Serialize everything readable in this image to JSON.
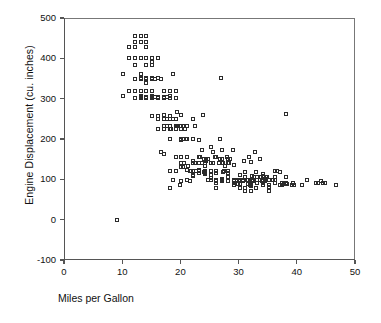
{
  "chart_data": {
    "type": "scatter",
    "title": "",
    "xlabel": "Miles per Gallon",
    "ylabel": "Engine Displacement (cu. inches)",
    "xlim": [
      0,
      50
    ],
    "ylim": [
      -100,
      500
    ],
    "xticks": [
      "0",
      "10",
      "20",
      "30",
      "40",
      "50"
    ],
    "xtick_values": [
      0,
      10,
      20,
      30,
      40,
      50
    ],
    "yticks": [
      "500",
      "400",
      "300",
      "200",
      "100",
      "0",
      "-100"
    ],
    "ytick_values": [
      500,
      400,
      300,
      200,
      100,
      0,
      -100
    ],
    "grid": false,
    "legend": "none",
    "marker": "open-square",
    "marker_color": "#2b2b2b",
    "series_name": "Automobiles",
    "points": [
      [
        9.0,
        0
      ],
      [
        10.0,
        307
      ],
      [
        10.0,
        360
      ],
      [
        11.0,
        318
      ],
      [
        11.0,
        429
      ],
      [
        11.0,
        400
      ],
      [
        12.0,
        455
      ],
      [
        12.0,
        383
      ],
      [
        12.0,
        400
      ],
      [
        12.0,
        350
      ],
      [
        12.0,
        350
      ],
      [
        12.0,
        318
      ],
      [
        12.0,
        302
      ],
      [
        12.0,
        429
      ],
      [
        12.0,
        440
      ],
      [
        13.0,
        400
      ],
      [
        13.0,
        350
      ],
      [
        13.0,
        351
      ],
      [
        13.0,
        440
      ],
      [
        13.0,
        455
      ],
      [
        13.0,
        350
      ],
      [
        13.0,
        318
      ],
      [
        13.0,
        302
      ],
      [
        13.0,
        307
      ],
      [
        13.0,
        304
      ],
      [
        13.0,
        350
      ],
      [
        13.0,
        400
      ],
      [
        13.0,
        360
      ],
      [
        13.0,
        307
      ],
      [
        13.0,
        318
      ],
      [
        13.0,
        400
      ],
      [
        14.0,
        455
      ],
      [
        14.0,
        440
      ],
      [
        14.0,
        455
      ],
      [
        14.0,
        350
      ],
      [
        14.0,
        351
      ],
      [
        14.0,
        383
      ],
      [
        14.0,
        340
      ],
      [
        14.0,
        400
      ],
      [
        14.0,
        302
      ],
      [
        14.0,
        350
      ],
      [
        14.0,
        318
      ],
      [
        14.0,
        429
      ],
      [
        14.0,
        304
      ],
      [
        14.0,
        351
      ],
      [
        14.0,
        400
      ],
      [
        15.0,
        350
      ],
      [
        15.0,
        400
      ],
      [
        15.0,
        383
      ],
      [
        15.0,
        350
      ],
      [
        15.0,
        351
      ],
      [
        15.0,
        302
      ],
      [
        15.0,
        304
      ],
      [
        15.0,
        318
      ],
      [
        15.0,
        307
      ],
      [
        15.0,
        390
      ],
      [
        15.0,
        400
      ],
      [
        15.0,
        350
      ],
      [
        15.0,
        258
      ],
      [
        15.5,
        350
      ],
      [
        15.5,
        304
      ],
      [
        16.0,
        250
      ],
      [
        16.0,
        225
      ],
      [
        16.0,
        258
      ],
      [
        16.0,
        302
      ],
      [
        16.0,
        304
      ],
      [
        16.0,
        351
      ],
      [
        16.0,
        250
      ],
      [
        16.0,
        400
      ],
      [
        16.0,
        305
      ],
      [
        16.5,
        350
      ],
      [
        16.5,
        168
      ],
      [
        16.5,
        168
      ],
      [
        17.0,
        250
      ],
      [
        17.0,
        231
      ],
      [
        17.0,
        225
      ],
      [
        17.0,
        305
      ],
      [
        17.0,
        302
      ],
      [
        17.0,
        318
      ],
      [
        17.0,
        260
      ],
      [
        17.0,
        163
      ],
      [
        17.5,
        250
      ],
      [
        17.5,
        305
      ],
      [
        17.5,
        231
      ],
      [
        18.0,
        307
      ],
      [
        18.0,
        318
      ],
      [
        18.0,
        250
      ],
      [
        18.0,
        225
      ],
      [
        18.0,
        232
      ],
      [
        18.0,
        258
      ],
      [
        18.0,
        302
      ],
      [
        18.0,
        121
      ],
      [
        18.0,
        199
      ],
      [
        18.0,
        78
      ],
      [
        18.1,
        258
      ],
      [
        18.2,
        225
      ],
      [
        18.5,
        360
      ],
      [
        18.5,
        250
      ],
      [
        18.5,
        98
      ],
      [
        19.0,
        232
      ],
      [
        19.0,
        250
      ],
      [
        19.0,
        225
      ],
      [
        19.0,
        156
      ],
      [
        19.0,
        250
      ],
      [
        19.0,
        120
      ],
      [
        19.0,
        121
      ],
      [
        19.0,
        232
      ],
      [
        19.0,
        318
      ],
      [
        19.0,
        302
      ],
      [
        19.2,
        267
      ],
      [
        19.2,
        232
      ],
      [
        19.4,
        232
      ],
      [
        19.8,
        85
      ],
      [
        19.9,
        260
      ],
      [
        20.0,
        198
      ],
      [
        20.0,
        225
      ],
      [
        20.0,
        232
      ],
      [
        20.0,
        200
      ],
      [
        20.0,
        140
      ],
      [
        20.0,
        130
      ],
      [
        20.0,
        131
      ],
      [
        20.0,
        156
      ],
      [
        20.0,
        232
      ],
      [
        20.0,
        97
      ],
      [
        20.2,
        232
      ],
      [
        20.2,
        200
      ],
      [
        20.3,
        131
      ],
      [
        20.5,
        200
      ],
      [
        20.5,
        140
      ],
      [
        20.6,
        225
      ],
      [
        20.8,
        200
      ],
      [
        21.0,
        200
      ],
      [
        21.0,
        199
      ],
      [
        21.0,
        122
      ],
      [
        21.0,
        231
      ],
      [
        21.0,
        98
      ],
      [
        21.0,
        155
      ],
      [
        21.1,
        134
      ],
      [
        21.5,
        121
      ],
      [
        21.5,
        97
      ],
      [
        21.6,
        121
      ],
      [
        22.0,
        250
      ],
      [
        22.0,
        121
      ],
      [
        22.0,
        146
      ],
      [
        22.0,
        200
      ],
      [
        22.0,
        140
      ],
      [
        22.0,
        108
      ],
      [
        22.0,
        110
      ],
      [
        22.3,
        140
      ],
      [
        22.4,
        231
      ],
      [
        22.5,
        120
      ],
      [
        23.0,
        120
      ],
      [
        23.0,
        198
      ],
      [
        23.0,
        156
      ],
      [
        23.0,
        115
      ],
      [
        23.0,
        140
      ],
      [
        23.0,
        122
      ],
      [
        23.0,
        140
      ],
      [
        23.2,
        156
      ],
      [
        23.5,
        173
      ],
      [
        23.6,
        140
      ],
      [
        23.7,
        260
      ],
      [
        23.8,
        151
      ],
      [
        23.9,
        119
      ],
      [
        24.0,
        121
      ],
      [
        24.0,
        113
      ],
      [
        24.0,
        116
      ],
      [
        24.0,
        134
      ],
      [
        24.0,
        140
      ],
      [
        24.0,
        120
      ],
      [
        24.2,
        146
      ],
      [
        24.3,
        151
      ],
      [
        24.5,
        151
      ],
      [
        24.5,
        98
      ],
      [
        25.0,
        98
      ],
      [
        25.0,
        140
      ],
      [
        25.0,
        110
      ],
      [
        25.0,
        104
      ],
      [
        25.0,
        121
      ],
      [
        25.0,
        98
      ],
      [
        25.0,
        181
      ],
      [
        25.1,
        140
      ],
      [
        25.4,
        168
      ],
      [
        25.5,
        140
      ],
      [
        25.8,
        156
      ],
      [
        26.0,
        96
      ],
      [
        26.0,
        97
      ],
      [
        26.0,
        98
      ],
      [
        26.0,
        91
      ],
      [
        26.0,
        121
      ],
      [
        26.0,
        156
      ],
      [
        26.0,
        79
      ],
      [
        26.0,
        116
      ],
      [
        26.4,
        140
      ],
      [
        26.5,
        140
      ],
      [
        26.6,
        151
      ],
      [
        26.6,
        200
      ],
      [
        26.8,
        351
      ],
      [
        27.0,
        97
      ],
      [
        27.0,
        101
      ],
      [
        27.0,
        98
      ],
      [
        27.0,
        151
      ],
      [
        27.0,
        140
      ],
      [
        27.0,
        173
      ],
      [
        27.2,
        141
      ],
      [
        27.2,
        119
      ],
      [
        27.4,
        121
      ],
      [
        27.5,
        134
      ],
      [
        27.9,
        156
      ],
      [
        28.0,
        97
      ],
      [
        28.0,
        107
      ],
      [
        28.0,
        116
      ],
      [
        28.0,
        140
      ],
      [
        28.0,
        120
      ],
      [
        28.0,
        151
      ],
      [
        28.1,
        141
      ],
      [
        28.4,
        151
      ],
      [
        28.8,
        173
      ],
      [
        29.0,
        90
      ],
      [
        29.0,
        98
      ],
      [
        29.0,
        97
      ],
      [
        29.0,
        135
      ],
      [
        29.0,
        85
      ],
      [
        29.5,
        98
      ],
      [
        29.5,
        97
      ],
      [
        29.8,
        89
      ],
      [
        29.9,
        98
      ],
      [
        30.0,
        88
      ],
      [
        30.0,
        97
      ],
      [
        30.0,
        111
      ],
      [
        30.0,
        79
      ],
      [
        30.0,
        98
      ],
      [
        30.5,
        97
      ],
      [
        30.5,
        98
      ],
      [
        30.7,
        145
      ],
      [
        30.9,
        105
      ],
      [
        31.0,
        71
      ],
      [
        31.0,
        79
      ],
      [
        31.0,
        119
      ],
      [
        31.3,
        98
      ],
      [
        31.5,
        89
      ],
      [
        31.5,
        98
      ],
      [
        31.6,
        156
      ],
      [
        31.8,
        85
      ],
      [
        31.9,
        89
      ],
      [
        32.0,
        83
      ],
      [
        32.0,
        71
      ],
      [
        32.0,
        85
      ],
      [
        32.0,
        91
      ],
      [
        32.0,
        144
      ],
      [
        32.1,
        98
      ],
      [
        32.2,
        108
      ],
      [
        32.3,
        97
      ],
      [
        32.4,
        107
      ],
      [
        32.7,
        168
      ],
      [
        32.8,
        78
      ],
      [
        32.9,
        119
      ],
      [
        33.0,
        91
      ],
      [
        33.0,
        98
      ],
      [
        33.0,
        105
      ],
      [
        33.5,
        151
      ],
      [
        33.5,
        98
      ],
      [
        33.7,
        107
      ],
      [
        33.8,
        97
      ],
      [
        34.0,
        108
      ],
      [
        34.0,
        97
      ],
      [
        34.0,
        112
      ],
      [
        34.1,
        86
      ],
      [
        34.1,
        91
      ],
      [
        34.2,
        105
      ],
      [
        34.3,
        97
      ],
      [
        34.4,
        98
      ],
      [
        34.5,
        105
      ],
      [
        34.5,
        100
      ],
      [
        34.7,
        105
      ],
      [
        35.0,
        72
      ],
      [
        35.0,
        85
      ],
      [
        35.0,
        98
      ],
      [
        35.1,
        81
      ],
      [
        35.7,
        98
      ],
      [
        36.0,
        107
      ],
      [
        36.0,
        120
      ],
      [
        36.0,
        98
      ],
      [
        36.1,
        91
      ],
      [
        36.4,
        121
      ],
      [
        37.0,
        85
      ],
      [
        37.0,
        119
      ],
      [
        37.2,
        86
      ],
      [
        37.3,
        91
      ],
      [
        37.7,
        89
      ],
      [
        38.0,
        262
      ],
      [
        38.0,
        105
      ],
      [
        38.0,
        91
      ],
      [
        38.1,
        89
      ],
      [
        39.0,
        86
      ],
      [
        39.1,
        91
      ],
      [
        39.4,
        85
      ],
      [
        40.8,
        85
      ],
      [
        41.5,
        98
      ],
      [
        43.1,
        90
      ],
      [
        43.4,
        90
      ],
      [
        44.0,
        97
      ],
      [
        44.3,
        90
      ],
      [
        44.6,
        91
      ],
      [
        46.6,
        86
      ]
    ]
  }
}
